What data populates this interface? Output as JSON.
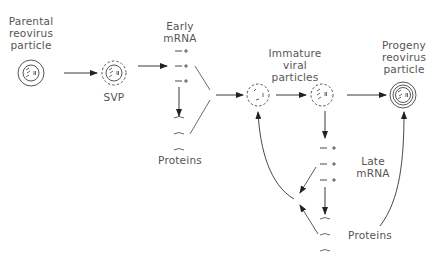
{
  "diagram": {
    "labels": {
      "parental": "Parental\nreovirus\nparticle",
      "svp": "SVP",
      "early_mrna": "Early\nmRNA",
      "early_proteins": "Proteins",
      "immature": "Immature\nviral\nparticles",
      "progeny": "Progeny\nreovirus\nparticle",
      "late_mrna": "Late\nmRNA",
      "late_proteins": "Proteins"
    },
    "mrna_symbol": "— +",
    "protein_symbol": "⁀",
    "colors": {
      "line": "#333333",
      "text": "#555555",
      "background": "#ffffff"
    }
  }
}
